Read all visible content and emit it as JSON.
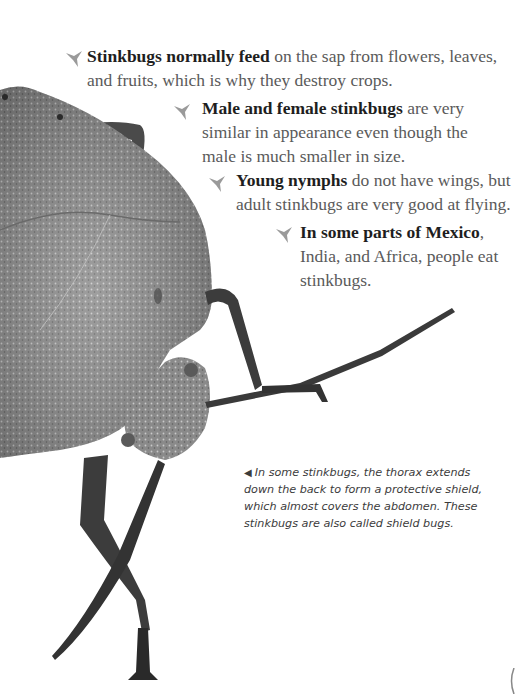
{
  "page": {
    "background": "#ffffff"
  },
  "facts": [
    {
      "icon": "stinkbug-bullet-icon",
      "bold": "Stinkbugs normally feed",
      "rest": " on the sap from flowers, leaves, and fruits, which is why they destroy crops."
    },
    {
      "icon": "stinkbug-bullet-icon",
      "bold": "Male and female stinkbugs",
      "rest": " are very similar in appearance even though the male is much smaller in size."
    },
    {
      "icon": "stinkbug-bullet-icon",
      "bold": "Young nymphs",
      "rest": " do not have wings, but adult stinkbugs are very good at flying."
    },
    {
      "icon": "stinkbug-bullet-icon",
      "bold": "In some parts of Mexico",
      "rest": ", India, and Africa, people eat stinkbugs."
    }
  ],
  "caption": {
    "arrow": "◀",
    "text": "In some stinkbugs, the thorax extends down the back to form a protective shield, which almost covers the abdomen. These stinkbugs are also called shield bugs."
  },
  "colors": {
    "body_text": "#5a5a5a",
    "bold_text": "#1e1e1e",
    "bullet": "#9a9a9a",
    "bug_shell": "#8c8c8c",
    "bug_dark": "#3a3a3a"
  }
}
